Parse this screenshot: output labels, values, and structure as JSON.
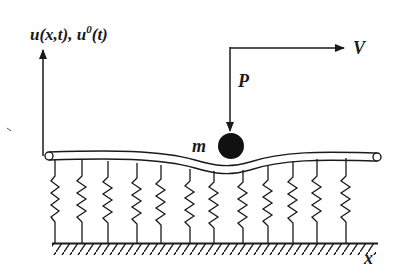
{
  "diagram": {
    "labels": {
      "displacement_axis": "u(x,t), u",
      "displacement_axis_sup": "0",
      "displacement_axis_tail": "(t)",
      "velocity": "V",
      "force": "P",
      "mass": "m",
      "position_axis": "x"
    },
    "colors": {
      "ink": "#1a1a1a",
      "background": "#ffffff",
      "mass_fill": "#111111"
    },
    "springs": {
      "count": 13,
      "top_x": [
        55,
        79,
        104,
        132,
        157,
        185,
        209,
        229,
        254,
        279,
        302,
        324,
        352
      ]
    },
    "nodes": [
      {
        "id": "beam",
        "type": "elastic beam (Euler-Bernoulli)"
      },
      {
        "id": "foundation",
        "type": "Winkler spring foundation"
      },
      {
        "id": "ground",
        "type": "fixed rigid base"
      },
      {
        "id": "mass",
        "type": "moving point mass"
      }
    ],
    "edges": [
      {
        "from": "mass",
        "to": "beam",
        "label": "rests on"
      },
      {
        "from": "beam",
        "to": "foundation",
        "label": "supported by"
      },
      {
        "from": "foundation",
        "to": "ground",
        "label": "attached to"
      }
    ]
  }
}
